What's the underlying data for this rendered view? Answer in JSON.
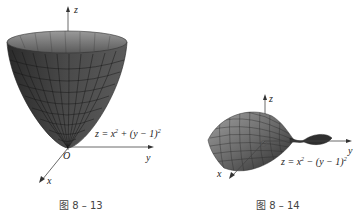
{
  "figures": [
    {
      "id": "fig-8-13",
      "caption": "图 8 – 13",
      "equation": {
        "prefix": "z = x",
        "exp1": "2",
        "mid": " + (y − 1)",
        "exp2": "2"
      },
      "surface": "elliptic paraboloid",
      "axes": {
        "z": "z",
        "y": "y",
        "x": "x",
        "origin": "O"
      },
      "colors": {
        "surface": "#3a3a3a",
        "surface_light": "#7a7a7a",
        "mesh": "#111111"
      }
    },
    {
      "id": "fig-8-14",
      "caption": "图 8 – 14",
      "equation": {
        "prefix": "z = x",
        "exp1": "2",
        "mid": " − (y − 1)",
        "exp2": "2"
      },
      "surface": "hyperbolic paraboloid (saddle)",
      "axes": {
        "z": "z",
        "y": "y",
        "x": "x",
        "origin": "O"
      },
      "colors": {
        "surface": "#555555",
        "surface_light": "#9a9a9a",
        "mesh": "#222222"
      }
    }
  ]
}
